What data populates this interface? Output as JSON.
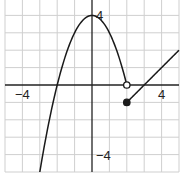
{
  "chart_data": {
    "type": "line",
    "title": "",
    "xlabel": "",
    "ylabel": "",
    "xlim": [
      -5,
      5
    ],
    "ylim": [
      -5,
      5
    ],
    "grid": true,
    "grid_step": 1,
    "tick_labels": {
      "x": [
        {
          "value": -4,
          "label": "−4"
        },
        {
          "value": 4,
          "label": "4"
        }
      ],
      "y": [
        {
          "value": 4,
          "label": "4"
        },
        {
          "value": -4,
          "label": "−4"
        }
      ]
    },
    "series": [
      {
        "name": "piece-1",
        "formula": "y = 4 - x^2",
        "x_range": [
          -3,
          2
        ],
        "endpoints": [
          {
            "x": 2,
            "y": 0,
            "style": "open"
          }
        ]
      },
      {
        "name": "piece-2",
        "formula": "y = x - 3",
        "x_range": [
          2,
          5
        ],
        "endpoints": [
          {
            "x": 2,
            "y": -1,
            "style": "closed"
          }
        ]
      }
    ],
    "colors": {
      "curve": "#1a1a1a",
      "grid": "#cfcfcf",
      "axis": "#222222"
    }
  }
}
